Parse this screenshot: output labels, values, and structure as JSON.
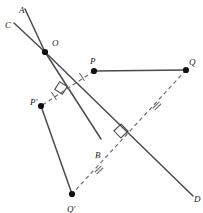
{
  "figure": {
    "type": "geometry-diagram",
    "width": 203,
    "height": 213,
    "background": "#ffffff",
    "stroke_solid": "#4a4a52",
    "stroke_dashed": "#6e6e76",
    "point_fill": "#111111",
    "label_color": "#1a1a1a"
  },
  "points": [
    {
      "id": "O",
      "label": "O",
      "x": 45,
      "y": 52,
      "dot": true,
      "lx": 52,
      "ly": 39
    },
    {
      "id": "P",
      "label": "P",
      "x": 94,
      "y": 71,
      "dot": true,
      "lx": 90,
      "ly": 57
    },
    {
      "id": "Q",
      "label": "Q",
      "x": 186,
      "y": 70,
      "dot": true,
      "lx": 189,
      "ly": 58
    },
    {
      "id": "Pp",
      "label": "P'",
      "x": 41,
      "y": 106,
      "dot": true,
      "lx": 30,
      "ly": 98
    },
    {
      "id": "Qp",
      "label": "Q'",
      "x": 72,
      "y": 194,
      "dot": true,
      "lx": 67,
      "ly": 205
    },
    {
      "id": "A",
      "label": "A",
      "x": 25,
      "y": 9,
      "dot": false,
      "lx": 19,
      "ly": 6
    },
    {
      "id": "C",
      "label": "C",
      "x": 14,
      "y": 23,
      "dot": false,
      "lx": 5,
      "ly": 21
    },
    {
      "id": "B",
      "label": "B",
      "x": 101,
      "y": 139,
      "dot": false,
      "lx": 95,
      "ly": 151
    },
    {
      "id": "D",
      "label": "D",
      "x": 193,
      "y": 196,
      "dot": false,
      "lx": 194,
      "ly": 195
    }
  ],
  "solid_segments": [
    {
      "name": "ray-OA",
      "x1": 25,
      "y1": 9,
      "x2": 45,
      "y2": 52
    },
    {
      "name": "ray-OC",
      "x1": 14,
      "y1": 23,
      "x2": 45,
      "y2": 52
    },
    {
      "name": "ray-OB",
      "x1": 45,
      "y1": 52,
      "x2": 101,
      "y2": 139
    },
    {
      "name": "line-OD",
      "x1": 45,
      "y1": 52,
      "x2": 193,
      "y2": 196
    },
    {
      "name": "segment-PQ",
      "x1": 94,
      "y1": 71,
      "x2": 186,
      "y2": 70
    },
    {
      "name": "segment-PpQp",
      "x1": 41,
      "y1": 106,
      "x2": 72,
      "y2": 194
    }
  ],
  "dashed_segments": [
    {
      "name": "segment-P-Pp",
      "x1": 94,
      "y1": 71,
      "x2": 41,
      "y2": 106
    },
    {
      "name": "segment-Q-Qp",
      "x1": 186,
      "y1": 70,
      "x2": 72,
      "y2": 194
    }
  ],
  "right_angle_marks": [
    {
      "name": "right-angle-at-PPp-crossing",
      "x": 61,
      "y": 88,
      "size": 9,
      "rotation": 33
    },
    {
      "name": "right-angle-at-QQp-crossing",
      "x": 121,
      "y": 131,
      "size": 10,
      "rotation": 46
    }
  ],
  "tick_marks": [
    {
      "name": "tick-P-side",
      "x": 82,
      "y": 77,
      "count": 1,
      "angle": -33
    },
    {
      "name": "tick-Pp-side",
      "x": 54,
      "y": 96,
      "count": 1,
      "angle": -33
    },
    {
      "name": "tick-Q-side",
      "x": 157,
      "y": 106,
      "count": 2,
      "angle": 46
    },
    {
      "name": "tick-Qp-side",
      "x": 99,
      "y": 170,
      "count": 2,
      "angle": 46
    }
  ]
}
